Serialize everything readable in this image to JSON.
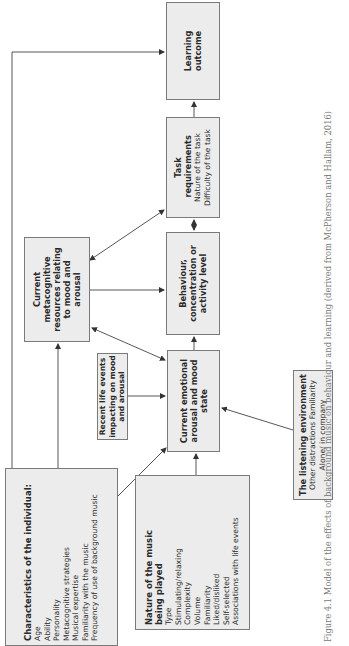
{
  "diagram": {
    "boxes": {
      "learning_outcome": {
        "title": "Learning outcome"
      },
      "task_requirements": {
        "title": "Task requirements",
        "items": [
          "Nature of the task",
          "Difficulty of the task"
        ]
      },
      "behaviour": {
        "title": "Behaviour, concentration or activity level"
      },
      "emotional_state": {
        "title": "Current emotional arousal and mood state"
      },
      "metacognitive": {
        "title": "Current metacognitive resources relating to mood and arousal"
      },
      "recent_life_events": {
        "title": "Recent life events impacting on mood and arousal"
      },
      "characteristics": {
        "title": "Characteristics of the individual:",
        "items": [
          "Age",
          "Ability",
          "Personality",
          "Metacognitive strategies",
          "Musical expertise",
          "Familiarity with the music",
          "Frequency of use of background music"
        ]
      },
      "nature_of_music": {
        "title": "Nature of the music being played",
        "items": [
          "Type",
          "Stimulating/relaxing",
          "Complexity",
          "Volume",
          "Familiarity",
          "Liked/disliked",
          "Self-selected",
          "Associations with life events"
        ]
      },
      "listening_environment": {
        "title": "The listening environment",
        "items": [
          "Other distractions Familiarity",
          "Alone/ in company"
        ]
      }
    },
    "caption": "Figure 4.1  Model of the effects of background music on behaviour and learning (derived from McPherson and Hallam, 2016)"
  },
  "colors": {
    "box_fill": "#ececec",
    "box_border": "#7a7a7a",
    "line": "#444444",
    "caption": "#777777"
  },
  "orientation": "rotated 90° counter-clockwise"
}
